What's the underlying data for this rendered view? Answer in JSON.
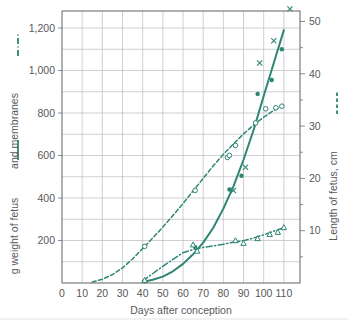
{
  "chart_data": {
    "type": "line",
    "title": "",
    "xlabel": "Days after conception",
    "ylabel_left": "g weight of fetus —— and membranes –·–",
    "ylabel_right": "Length of fetus, cm",
    "xlim": [
      0,
      118
    ],
    "ylim_left": [
      0,
      1280
    ],
    "ylim_right": [
      0,
      52
    ],
    "grid": true,
    "x_ticks": [
      0,
      10,
      20,
      30,
      40,
      50,
      60,
      70,
      80,
      90,
      100,
      110
    ],
    "x_tick_labels": [
      "0",
      "10",
      "20",
      "30",
      "40",
      "50",
      "60",
      "70",
      "80",
      "90",
      "100",
      "110"
    ],
    "y_ticks_left": [
      200,
      400,
      600,
      800,
      1000,
      1200
    ],
    "y_tick_labels_left": [
      "200",
      "400",
      "600",
      "800",
      "1,000",
      "1,200"
    ],
    "y_minor_ticks_left": [
      100,
      300,
      500,
      700,
      900,
      1100
    ],
    "y_ticks_right": [
      10,
      20,
      30,
      40,
      50
    ],
    "y_tick_labels_right": [
      "10",
      "20",
      "30",
      "40",
      "50"
    ],
    "y_minor_ticks_right": [
      5,
      15,
      25,
      35,
      45
    ],
    "accent_color": "#2e8573",
    "grid_color": "#b9bcbe",
    "text_color": "#58595b",
    "legend_position": "axis-labels",
    "series": [
      {
        "name": "weight of fetus",
        "axis": "left",
        "style": "solid",
        "marker": "filled-circle",
        "x": [
          40,
          45,
          50,
          55,
          60,
          65,
          70,
          75,
          80,
          85,
          90,
          95,
          100,
          105,
          110
        ],
        "y": [
          5,
          15,
          30,
          55,
          90,
          135,
          190,
          260,
          350,
          455,
          580,
          720,
          880,
          1035,
          1190
        ]
      },
      {
        "name": "weight of fetus observations",
        "axis": "left",
        "style": "none",
        "marker": "filled-circle",
        "x": [
          41,
          66,
          83,
          89,
          97,
          104,
          109
        ],
        "y": [
          8,
          170,
          440,
          505,
          890,
          955,
          1100
        ]
      },
      {
        "name": "weight of fetus scatter",
        "axis": "left",
        "style": "none",
        "marker": "cross",
        "x": [
          85,
          91,
          98,
          105,
          113
        ],
        "y": [
          435,
          545,
          1035,
          1140,
          1290
        ]
      },
      {
        "name": "length of fetus",
        "axis": "right",
        "style": "dashed",
        "marker": "open-circle",
        "x": [
          15,
          20,
          25,
          30,
          35,
          40,
          45,
          50,
          55,
          60,
          65,
          70,
          75,
          80,
          85,
          90,
          95,
          100,
          105,
          110
        ],
        "y": [
          0.2,
          0.7,
          1.6,
          2.9,
          4.6,
          6.6,
          8.6,
          10.7,
          12.9,
          15.2,
          17.6,
          20.0,
          22.4,
          24.6,
          26.6,
          28.5,
          30.2,
          31.7,
          33.0,
          34.0
        ]
      },
      {
        "name": "length of fetus observations",
        "axis": "right",
        "style": "none",
        "marker": "open-circle",
        "x": [
          41,
          66,
          82,
          83,
          86,
          96,
          101,
          106,
          109
        ],
        "y": [
          7.0,
          17.7,
          24.0,
          24.4,
          26.3,
          30.6,
          33.3,
          33.5,
          33.8
        ]
      },
      {
        "name": "membranes",
        "axis": "right",
        "style": "dash-dot",
        "marker": "open-triangle",
        "x": [
          40,
          50,
          60,
          65,
          70,
          75,
          80,
          85,
          90,
          95,
          100,
          105,
          110
        ],
        "y": [
          0.4,
          3.2,
          5.8,
          6.4,
          6.8,
          7.1,
          7.4,
          7.8,
          8.1,
          8.6,
          9.2,
          9.9,
          10.6
        ],
        "observations": {
          "x": [
            41,
            65,
            67,
            86,
            90,
            97,
            103,
            107,
            110
          ],
          "y": [
            0.5,
            7.3,
            6.1,
            8.1,
            7.6,
            8.5,
            9.3,
            9.7,
            10.6
          ]
        }
      }
    ]
  },
  "legend": {
    "left_solid_label": "g weight of fetus",
    "left_dashdot_label": "and membranes",
    "right_dashed_label": "Length of fetus, cm"
  }
}
